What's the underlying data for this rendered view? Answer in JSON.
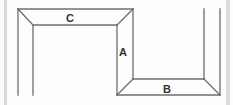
{
  "diagram": {
    "labels": {
      "a": "A",
      "b": "B",
      "c": "C"
    },
    "colors": {
      "line": "#6e6e6e",
      "frame_edge": "#d9d9d9",
      "background": "#fdfdfd"
    }
  }
}
